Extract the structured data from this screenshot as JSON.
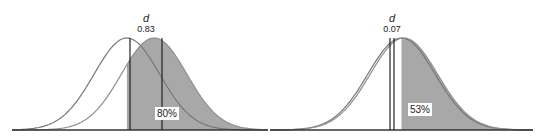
{
  "chart_data": [
    {
      "type": "area",
      "title": "Effect size d = 0.83",
      "d_symbol": "d",
      "d_value": "0.83",
      "percent_label": "80%",
      "description": "Two normal distributions shifted by d; shaded area of shifted distribution above the mean of the reference distribution",
      "series": [
        {
          "name": "reference distribution",
          "mean": 0,
          "sd": 1,
          "fill": "none"
        },
        {
          "name": "shifted distribution",
          "mean": 0.83,
          "sd": 1,
          "fill": "shaded above reference mean"
        }
      ],
      "shaded_proportion": 0.8,
      "x_range": [
        -3.5,
        4.3
      ],
      "axis": {
        "ticks": false,
        "grid": false
      }
    },
    {
      "type": "area",
      "title": "Effect size d = 0.07",
      "d_symbol": "d",
      "d_value": "0.07",
      "percent_label": "53%",
      "description": "Two nearly overlapping normal distributions shifted by d; shaded area above the reference mean",
      "series": [
        {
          "name": "reference distribution",
          "mean": 0,
          "sd": 1,
          "fill": "none"
        },
        {
          "name": "shifted distribution",
          "mean": 0.07,
          "sd": 1,
          "fill": "shaded above reference mean"
        }
      ],
      "shaded_proportion": 0.53,
      "x_range": [
        -3.9,
        3.9
      ],
      "axis": {
        "ticks": false,
        "grid": false
      }
    }
  ],
  "colors": {
    "shade": "#a8a8a8",
    "curve_reference": "#777777",
    "curve_shifted": "#8f8f8f",
    "line": "#222222",
    "baseline": "#333333",
    "label_bg": "#ffffff"
  },
  "layout": [
    {
      "x0": 12,
      "x1": 268,
      "baseline_y": 130,
      "peak_y": 38,
      "mean_ref_x": 130,
      "mean_shift_x": 162,
      "label_x": 146,
      "pct_box_x": 167,
      "pct_box_y": 117
    },
    {
      "x0": 270,
      "x1": 533,
      "baseline_y": 130,
      "peak_y": 38,
      "mean_ref_x": 390,
      "mean_shift_x": 394,
      "label_x": 392,
      "pct_box_x": 420,
      "pct_box_y": 113
    }
  ]
}
